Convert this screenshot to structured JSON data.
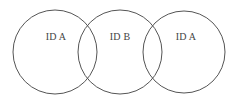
{
  "diagram": {
    "type": "venn",
    "stroke_color": "#555555",
    "circles": [
      {
        "id": "circle-left",
        "label": "ID A",
        "cx": 55,
        "cy": 52,
        "r": 42,
        "label_x": 55,
        "label_y": 36
      },
      {
        "id": "circle-middle",
        "label": "ID B",
        "cx": 120,
        "cy": 52,
        "r": 42,
        "label_x": 120,
        "label_y": 36
      },
      {
        "id": "circle-right",
        "label": "ID A",
        "cx": 184,
        "cy": 52,
        "r": 41,
        "label_x": 187,
        "label_y": 36
      }
    ]
  }
}
